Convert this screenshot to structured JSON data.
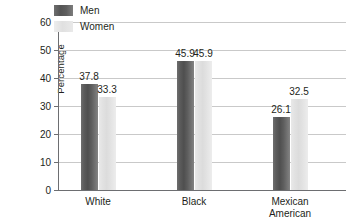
{
  "chart_data": {
    "type": "bar",
    "title": "",
    "xlabel": "",
    "ylabel": "Percentage",
    "ylim": [
      0,
      60
    ],
    "yticks": [
      0,
      10,
      20,
      30,
      40,
      50,
      60
    ],
    "ytick_labels": [
      "0",
      "10",
      "20",
      "30",
      "40",
      "50",
      "60"
    ],
    "grid": true,
    "legend_position": "top-left",
    "categories": [
      "White",
      "Black",
      "Mexican\nAmerican"
    ],
    "series": [
      {
        "name": "Men",
        "color": "#545454",
        "values": [
          37.8,
          45.9,
          26.1
        ],
        "value_labels": [
          "37.8",
          "45.9",
          "26.1"
        ]
      },
      {
        "name": "Women",
        "color": "#e0e0e0",
        "values": [
          33.3,
          45.9,
          32.5
        ],
        "value_labels": [
          "33.3",
          "45.9",
          "32.5"
        ]
      }
    ]
  },
  "legend": {
    "items": [
      {
        "label": "Men"
      },
      {
        "label": "Women"
      }
    ]
  },
  "axis": {
    "y_title": "Percentage"
  },
  "colors": {
    "axis": "#6d6e71",
    "grid": "#c9c9c9",
    "text": "#231f20",
    "men": "#545454",
    "women": "#e0e0e0",
    "background": "#ffffff"
  }
}
